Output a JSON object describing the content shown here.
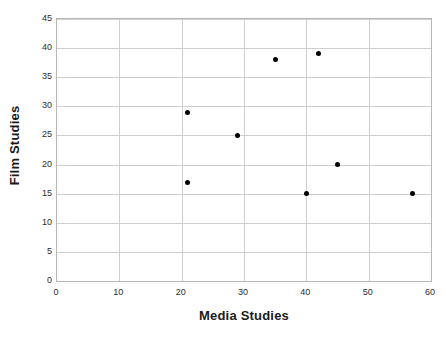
{
  "chart_data": {
    "type": "scatter",
    "title": "",
    "xlabel": "Media Studies",
    "ylabel": "Film Studies",
    "xlim": [
      0,
      60
    ],
    "ylim": [
      0,
      45
    ],
    "xticks": [
      0,
      10,
      20,
      30,
      40,
      50,
      60
    ],
    "yticks": [
      0,
      5,
      10,
      15,
      20,
      25,
      30,
      35,
      40,
      45
    ],
    "grid": true,
    "legend": null,
    "marker_color": "#000000",
    "gridline_color": "#cfcfcf",
    "axis_color": "#b8b8b8",
    "points": [
      {
        "x": 21,
        "y": 29
      },
      {
        "x": 21,
        "y": 17
      },
      {
        "x": 29,
        "y": 25
      },
      {
        "x": 35,
        "y": 38
      },
      {
        "x": 40,
        "y": 15
      },
      {
        "x": 42,
        "y": 39
      },
      {
        "x": 45,
        "y": 20
      },
      {
        "x": 57,
        "y": 15
      }
    ]
  }
}
